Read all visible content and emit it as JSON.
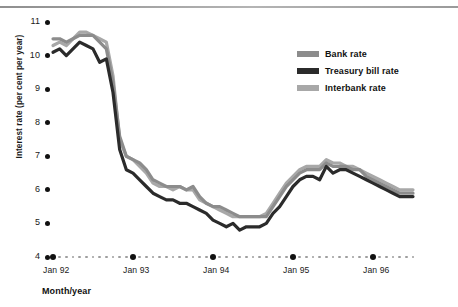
{
  "chart_data": {
    "type": "line",
    "title": "",
    "xlabel": "Month/year",
    "ylabel": "Interest rate (per cent per year)",
    "ylim": [
      4,
      11
    ],
    "yticks": [
      4,
      5,
      6,
      7,
      8,
      9,
      10,
      11
    ],
    "xticks": [
      "Jan 92",
      "Jan 93",
      "Jan 94",
      "Jan 95",
      "Jan 96"
    ],
    "x_minor_unit": "month",
    "grid": false,
    "legend_position": "top-right",
    "series": [
      {
        "name": "Bank rate",
        "color": "#8c8c8c",
        "values": [
          10.5,
          10.5,
          10.4,
          10.5,
          10.6,
          10.6,
          10.6,
          10.4,
          10.2,
          9.2,
          7.6,
          7.0,
          6.9,
          6.8,
          6.6,
          6.3,
          6.2,
          6.1,
          6.1,
          6.1,
          6.0,
          6.1,
          5.8,
          5.6,
          5.5,
          5.5,
          5.4,
          5.3,
          5.2,
          5.2,
          5.2,
          5.2,
          5.2,
          5.5,
          5.8,
          6.1,
          6.3,
          6.5,
          6.6,
          6.6,
          6.6,
          6.8,
          6.7,
          6.7,
          6.7,
          6.6,
          6.6,
          6.4,
          6.3,
          6.2,
          6.1,
          6.0,
          5.9,
          5.9,
          5.9
        ]
      },
      {
        "name": "Treasury bill rate",
        "color": "#2b2b2b",
        "values": [
          10.1,
          10.2,
          10.0,
          10.2,
          10.4,
          10.3,
          10.2,
          9.8,
          9.9,
          8.9,
          7.2,
          6.6,
          6.5,
          6.3,
          6.1,
          5.9,
          5.8,
          5.7,
          5.7,
          5.6,
          5.6,
          5.5,
          5.4,
          5.3,
          5.1,
          5.0,
          4.9,
          5.0,
          4.8,
          4.9,
          4.9,
          4.9,
          5.0,
          5.3,
          5.5,
          5.8,
          6.1,
          6.3,
          6.4,
          6.4,
          6.3,
          6.7,
          6.5,
          6.6,
          6.6,
          6.5,
          6.4,
          6.3,
          6.2,
          6.1,
          6.0,
          5.9,
          5.8,
          5.8,
          5.8
        ]
      },
      {
        "name": "Interbank rate",
        "color": "#a8a8a8",
        "values": [
          10.3,
          10.4,
          10.3,
          10.5,
          10.7,
          10.7,
          10.6,
          10.5,
          10.4,
          9.4,
          7.5,
          7.0,
          6.9,
          6.7,
          6.5,
          6.2,
          6.1,
          6.1,
          6.0,
          6.1,
          6.0,
          6.0,
          5.7,
          5.6,
          5.5,
          5.4,
          5.3,
          5.2,
          5.2,
          5.2,
          5.2,
          5.2,
          5.3,
          5.6,
          5.9,
          6.2,
          6.4,
          6.6,
          6.7,
          6.7,
          6.7,
          6.9,
          6.8,
          6.8,
          6.7,
          6.7,
          6.6,
          6.5,
          6.4,
          6.3,
          6.2,
          6.1,
          6.0,
          6.0,
          6.0
        ]
      }
    ]
  },
  "axis": {
    "ylabel": "Interest rate (per cent per year)",
    "xlabel": "Month/year",
    "yticks": [
      "11",
      "10",
      "9",
      "8",
      "7",
      "6",
      "5",
      "4"
    ],
    "xticks": [
      "Jan 92",
      "Jan 93",
      "Jan 94",
      "Jan 95",
      "Jan 96"
    ]
  },
  "legend": {
    "items": [
      {
        "label": "Bank rate",
        "color": "#8c8c8c"
      },
      {
        "label": "Treasury bill rate",
        "color": "#2b2b2b"
      },
      {
        "label": "Interbank rate",
        "color": "#a8a8a8"
      }
    ]
  }
}
